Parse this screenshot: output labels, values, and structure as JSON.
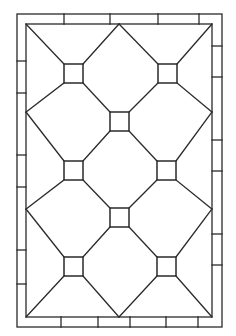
{
  "diagram": {
    "colors": {
      "line": "#2a2a2a",
      "background": "#ffffff"
    },
    "outer_frame": {
      "x1": 17,
      "y1": 14,
      "x2": 222,
      "y2": 327
    },
    "inner_frame": {
      "x1": 26,
      "y1": 24,
      "x2": 212,
      "y2": 317
    },
    "border_ticks": {
      "top_x": [
        64,
        110,
        158,
        199
      ],
      "bottom_x": [
        61,
        98,
        130,
        166,
        198
      ],
      "left_y": [
        61,
        93,
        155,
        187,
        250,
        284
      ],
      "right_y": [
        46,
        77,
        140,
        171,
        234,
        265
      ]
    },
    "squares": [
      {
        "name": "square-top-left",
        "x": 64,
        "y": 64,
        "s": 19
      },
      {
        "name": "square-top-right",
        "x": 158,
        "y": 64,
        "s": 19
      },
      {
        "name": "square-center-top",
        "x": 110,
        "y": 112,
        "s": 19
      },
      {
        "name": "square-middle-left",
        "x": 64,
        "y": 161,
        "s": 19
      },
      {
        "name": "square-middle-right",
        "x": 157,
        "y": 161,
        "s": 19
      },
      {
        "name": "square-center-bottom",
        "x": 110,
        "y": 208,
        "s": 19
      },
      {
        "name": "square-bottom-left",
        "x": 64,
        "y": 257,
        "s": 19
      },
      {
        "name": "square-bottom-right",
        "x": 157,
        "y": 257,
        "s": 19
      }
    ],
    "edge_vertices": {
      "left": [
        112,
        209
      ],
      "right": [
        112,
        209
      ],
      "top": [
        119
      ],
      "bottom": [
        119
      ]
    }
  }
}
